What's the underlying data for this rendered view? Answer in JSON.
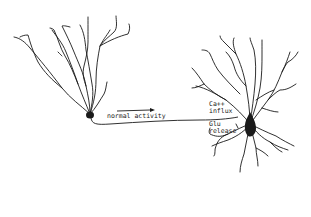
{
  "diagram": {
    "type": "neuron-signaling-illustration",
    "left_neuron": {
      "role": "presynaptic-neuron"
    },
    "right_neuron": {
      "role": "postsynaptic-pyramidal-neuron"
    },
    "labels": {
      "arrow_label": "normal activity",
      "ca_influx_line1": "Ca++",
      "ca_influx_line2": "influx",
      "glu_release_line1": "Glu",
      "glu_release_line2": "release"
    },
    "colors": {
      "ink": "#1a1a1a",
      "background": "#ffffff"
    }
  }
}
